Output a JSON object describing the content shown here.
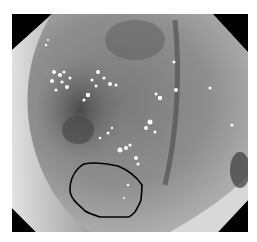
{
  "image": {
    "description": "Grayscale endoscopic view of colonic mucosa with specular highlights and an outlined lesion region",
    "frame": {
      "x": 12,
      "y": 14,
      "width": 236,
      "height": 218
    },
    "annotation": {
      "type": "freehand-outline",
      "color": "#000000",
      "label": "",
      "points": [
        [
          84,
          164
        ],
        [
          98,
          162
        ],
        [
          118,
          166
        ],
        [
          136,
          176
        ],
        [
          142,
          185
        ],
        [
          141,
          200
        ],
        [
          135,
          212
        ],
        [
          128,
          217
        ],
        [
          100,
          217
        ],
        [
          85,
          211
        ],
        [
          74,
          200
        ],
        [
          70,
          190
        ],
        [
          73,
          176
        ]
      ]
    }
  }
}
